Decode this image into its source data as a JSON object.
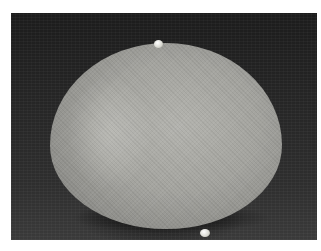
{
  "image": {
    "subject": "large egg with two small eggs on dark background",
    "style": "black-and-white photograph",
    "colors": {
      "background": "#262626",
      "egg": "#a8a8a3",
      "small_egg": "#e8e8e2",
      "border": "#ffffff"
    }
  }
}
